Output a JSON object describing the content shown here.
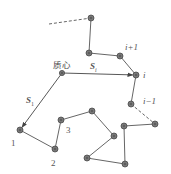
{
  "diagram": {
    "type": "polymer-chain-center-of-mass",
    "colors": {
      "bond": "#666666",
      "node_fill": "#777777",
      "node_stroke": "#4a4a4a",
      "vector": "#444444",
      "text": "#555555"
    },
    "labels": {
      "center_of_mass": "质心",
      "vector_i": "S",
      "vector_i_sub": "i",
      "vector_1": "S",
      "vector_1_sub": "1",
      "node_i": "i",
      "node_i_plus_1": "i+1",
      "node_i_minus_1": "i−1",
      "node_1": "1",
      "node_2": "2",
      "node_3": "3"
    },
    "nodes": [
      {
        "id": "top",
        "x": 91,
        "y": 18
      },
      {
        "id": "n_a",
        "x": 89,
        "y": 53
      },
      {
        "id": "i+1",
        "x": 120,
        "y": 56
      },
      {
        "id": "i",
        "x": 136,
        "y": 75
      },
      {
        "id": "i-1",
        "x": 131,
        "y": 104
      },
      {
        "id": "n_b",
        "x": 155,
        "y": 124
      },
      {
        "id": "n_c",
        "x": 124,
        "y": 126
      },
      {
        "id": "n_d",
        "x": 125,
        "y": 164
      },
      {
        "id": "n_e",
        "x": 87,
        "y": 158
      },
      {
        "id": "n_f",
        "x": 114,
        "y": 136
      },
      {
        "id": "n_g",
        "x": 92,
        "y": 111
      },
      {
        "id": "3",
        "x": 61,
        "y": 120
      },
      {
        "id": "2",
        "x": 55,
        "y": 149
      },
      {
        "id": "1",
        "x": 20,
        "y": 130
      },
      {
        "id": "center_of_mass",
        "x": 62,
        "y": 73
      }
    ],
    "bonds_solid": [
      [
        "top",
        "n_a"
      ],
      [
        "n_a",
        "i+1"
      ],
      [
        "i+1",
        "i"
      ],
      [
        "i",
        "i-1"
      ],
      [
        "n_b",
        "n_c"
      ],
      [
        "n_c",
        "n_d"
      ],
      [
        "n_d",
        "n_e"
      ],
      [
        "n_e",
        "n_f"
      ],
      [
        "n_f",
        "n_g"
      ],
      [
        "n_g",
        "3"
      ],
      [
        "3",
        "2"
      ],
      [
        "2",
        "1"
      ]
    ],
    "bonds_dashed": [
      [
        {
          "x": 49,
          "y": 24
        },
        {
          "x": 91,
          "y": 18
        }
      ],
      [
        {
          "x": 131,
          "y": 104
        },
        {
          "x": 155,
          "y": 124
        }
      ]
    ],
    "vectors": [
      {
        "name": "S_i",
        "from": "center_of_mass",
        "to": "i"
      },
      {
        "name": "S_1",
        "from": "center_of_mass",
        "to": "1"
      }
    ]
  }
}
